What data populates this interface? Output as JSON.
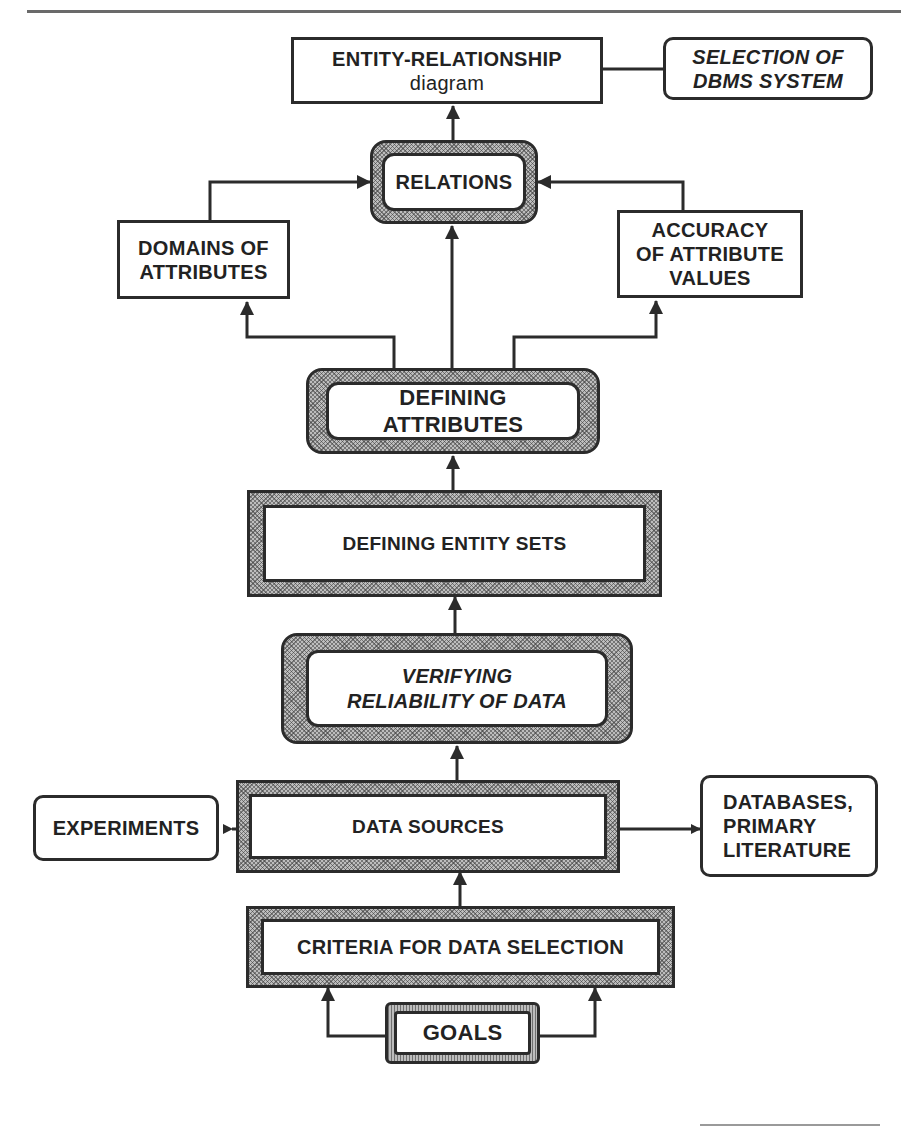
{
  "diagram": {
    "nodes": {
      "er_diagram": {
        "line1": "ENTITY-RELATIONSHIP",
        "line2": "diagram"
      },
      "dbms_selection": {
        "line1": "SELECTION OF",
        "line2": "DBMS SYSTEM"
      },
      "relations": {
        "label": "RELATIONS"
      },
      "domains": {
        "line1": "DOMAINS OF",
        "line2": "ATTRIBUTES"
      },
      "accuracy": {
        "line1": "ACCURACY",
        "line2": "OF ATTRIBUTE",
        "line3": "VALUES"
      },
      "defining_attributes": {
        "line1": "DEFINING",
        "line2": "ATTRIBUTES"
      },
      "defining_entity_sets": {
        "label": "DEFINING ENTITY SETS"
      },
      "verifying": {
        "line1": "VERIFYING",
        "line2": "RELIABILITY OF DATA"
      },
      "data_sources": {
        "label": "DATA SOURCES"
      },
      "experiments": {
        "label": "EXPERIMENTS"
      },
      "databases": {
        "line1": "DATABASES,",
        "line2": "PRIMARY",
        "line3": "LITERATURE"
      },
      "criteria": {
        "label": "CRITERIA FOR DATA SELECTION"
      },
      "goals": {
        "label": "GOALS"
      }
    },
    "edges": [
      {
        "from": "goals",
        "to": "criteria",
        "type": "arrow"
      },
      {
        "from": "criteria",
        "to": "data_sources",
        "type": "arrow"
      },
      {
        "from": "experiments",
        "to": "data_sources",
        "type": "bidirectional"
      },
      {
        "from": "databases",
        "to": "data_sources",
        "type": "bidirectional"
      },
      {
        "from": "data_sources",
        "to": "verifying",
        "type": "arrow"
      },
      {
        "from": "verifying",
        "to": "defining_entity_sets",
        "type": "arrow"
      },
      {
        "from": "defining_entity_sets",
        "to": "defining_attributes",
        "type": "arrow"
      },
      {
        "from": "defining_attributes",
        "to": "domains",
        "type": "arrow"
      },
      {
        "from": "defining_attributes",
        "to": "relations",
        "type": "arrow"
      },
      {
        "from": "defining_attributes",
        "to": "accuracy",
        "type": "arrow"
      },
      {
        "from": "domains",
        "to": "relations",
        "type": "arrow"
      },
      {
        "from": "accuracy",
        "to": "relations",
        "type": "arrow"
      },
      {
        "from": "relations",
        "to": "er_diagram",
        "type": "arrow"
      },
      {
        "from": "er_diagram",
        "to": "dbms_selection",
        "type": "line"
      }
    ],
    "colors": {
      "ink": "#2b2b2b",
      "hatch": "#bdbdbd",
      "background": "#ffffff"
    }
  }
}
